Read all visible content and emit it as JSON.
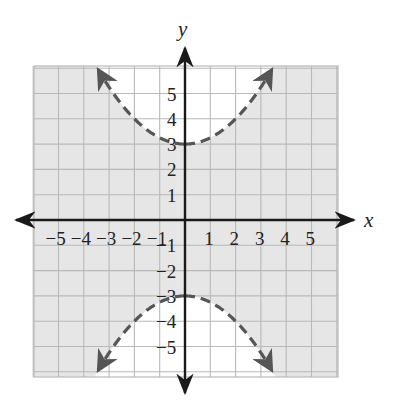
{
  "chart_data": {
    "type": "line",
    "title": "",
    "xlabel": "x",
    "ylabel": "y",
    "xlim": [
      -6,
      6
    ],
    "ylim": [
      -6,
      6
    ],
    "grid": true,
    "x_tick_labels": [
      "−5",
      "−4",
      "−3",
      "−2",
      "−1",
      "1",
      "2",
      "3",
      "4",
      "5"
    ],
    "y_tick_labels": [
      "5",
      "4",
      "3",
      "2",
      "1",
      "−1",
      "−2",
      "−3",
      "−4",
      "−5"
    ],
    "series": [
      {
        "name": "upper boundary",
        "equation": "y = x^2/4 + 3",
        "style": "dashed",
        "vertex": [
          0,
          3
        ],
        "x": [
          -3.46,
          -3,
          -2,
          -1,
          0,
          1,
          2,
          3,
          3.46
        ],
        "y": [
          6,
          5.25,
          4,
          3.25,
          3,
          3.25,
          4,
          5.25,
          6
        ]
      },
      {
        "name": "lower boundary",
        "equation": "y = -x^2/4 - 3",
        "style": "dashed",
        "vertex": [
          0,
          -3
        ],
        "x": [
          -3.46,
          -3,
          -2,
          -1,
          0,
          1,
          2,
          3,
          3.46
        ],
        "y": [
          -6,
          -5.25,
          -4,
          -3.25,
          -3,
          -3.25,
          -4,
          -5.25,
          -6
        ]
      }
    ],
    "shading": "shaded region between the two dashed curves (outside the parabola interiors); regions above the upper curve and below the lower curve unshaded",
    "colors": {
      "shade": "#e6e6e6",
      "grid": "#b9b9b9",
      "curve": "#555555",
      "axis": "#1a1a1a"
    }
  }
}
